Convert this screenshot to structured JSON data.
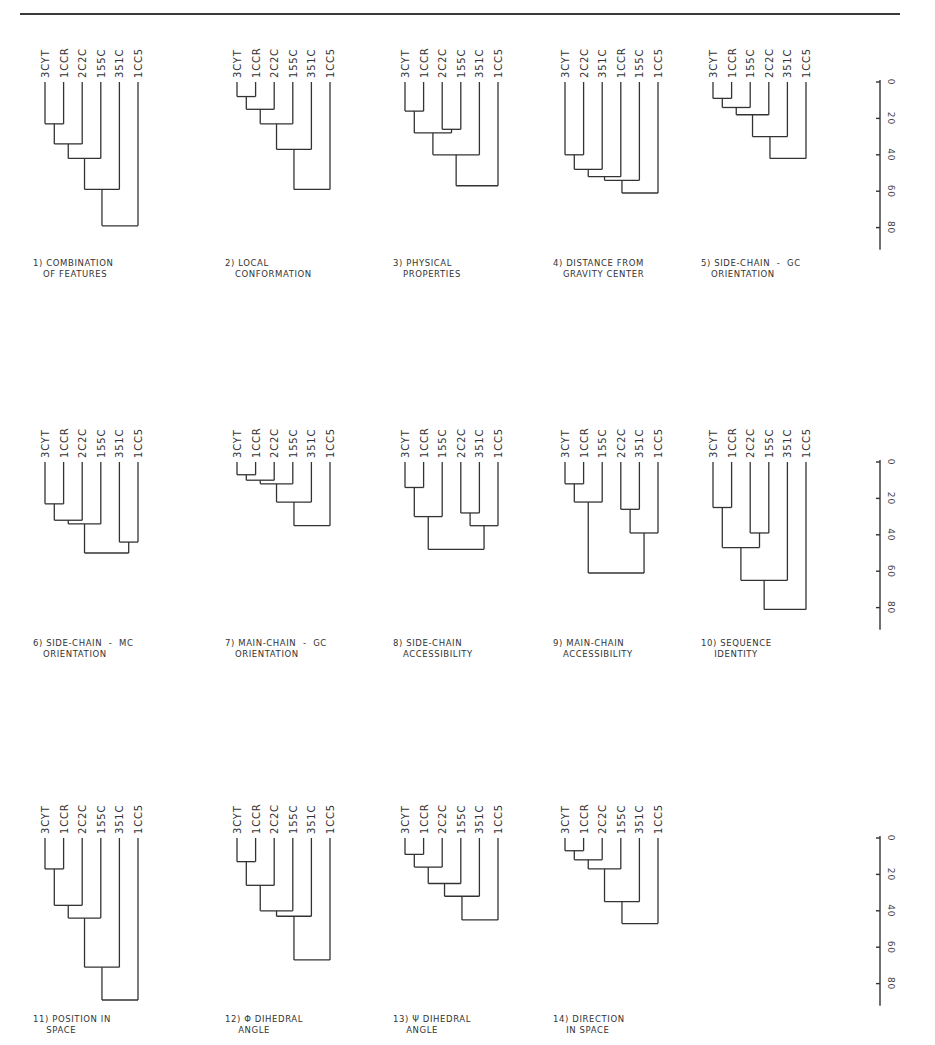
{
  "header": {
    "left_page": "",
    "center_title": "",
    "right_page": ""
  },
  "leaf_labels_note": "Protein codes",
  "axis": {
    "ticks": [
      0,
      20,
      40,
      60,
      80
    ],
    "min": 0,
    "max": 90
  },
  "chart_data": [
    {
      "id": 1,
      "type": "dendrogram",
      "title": "1) COMBINATION\n   OF FEATURES",
      "leaves": [
        "3CYT",
        "1CCR",
        "2C2C",
        "155C",
        "351C",
        "1CC5"
      ],
      "merges": [
        [
          0,
          1,
          23
        ],
        [
          0,
          2,
          34
        ],
        [
          0,
          3,
          42
        ],
        [
          0,
          4,
          59
        ],
        [
          0,
          5,
          79
        ]
      ]
    },
    {
      "id": 2,
      "type": "dendrogram",
      "title": "2) LOCAL\n   CONFORMATION",
      "leaves": [
        "3CYT",
        "1CCR",
        "2C2C",
        "155C",
        "351C",
        "1CC5"
      ],
      "merges": [
        [
          0,
          1,
          8
        ],
        [
          0,
          2,
          15
        ],
        [
          0,
          3,
          23
        ],
        [
          0,
          4,
          37
        ],
        [
          0,
          5,
          59
        ]
      ]
    },
    {
      "id": 3,
      "type": "dendrogram",
      "title": "3) PHYSICAL\n   PROPERTIES",
      "leaves": [
        "3CYT",
        "1CCR",
        "2C2C",
        "155C",
        "351C",
        "1CC5"
      ],
      "merges": [
        [
          0,
          1,
          16
        ],
        [
          2,
          3,
          26
        ],
        [
          0,
          2,
          28
        ],
        [
          0,
          4,
          40
        ],
        [
          0,
          5,
          57
        ]
      ]
    },
    {
      "id": 4,
      "type": "dendrogram",
      "title": "4) DISTANCE FROM\n   GRAVITY CENTER",
      "leaves": [
        "3CYT",
        "2C2C",
        "351C",
        "1CCR",
        "155C",
        "1CC5"
      ],
      "merges": [
        [
          0,
          1,
          40
        ],
        [
          0,
          2,
          48
        ],
        [
          0,
          3,
          52
        ],
        [
          0,
          4,
          54
        ],
        [
          0,
          5,
          61
        ]
      ]
    },
    {
      "id": 5,
      "type": "dendrogram",
      "title": "5) SIDE-CHAIN  -  GC\n   ORIENTATION",
      "leaves": [
        "3CYT",
        "1CCR",
        "155C",
        "2C2C",
        "351C",
        "1CC5"
      ],
      "merges": [
        [
          0,
          1,
          9
        ],
        [
          0,
          2,
          14
        ],
        [
          0,
          3,
          18
        ],
        [
          0,
          4,
          30
        ],
        [
          0,
          5,
          42
        ]
      ]
    },
    {
      "id": 6,
      "type": "dendrogram",
      "title": "6) SIDE-CHAIN  -  MC\n   ORIENTATION",
      "leaves": [
        "3CYT",
        "1CCR",
        "2C2C",
        "155C",
        "351C",
        "1CC5"
      ],
      "merges": [
        [
          0,
          1,
          23
        ],
        [
          0,
          2,
          32
        ],
        [
          0,
          3,
          34
        ],
        [
          4,
          5,
          44
        ],
        [
          0,
          4,
          50
        ]
      ]
    },
    {
      "id": 7,
      "type": "dendrogram",
      "title": "7) MAIN-CHAIN  -  GC\n   ORIENTATION",
      "leaves": [
        "3CYT",
        "1CCR",
        "2C2C",
        "155C",
        "351C",
        "1CC5"
      ],
      "merges": [
        [
          0,
          1,
          7
        ],
        [
          0,
          2,
          10
        ],
        [
          0,
          3,
          12
        ],
        [
          0,
          4,
          22
        ],
        [
          0,
          5,
          35
        ]
      ]
    },
    {
      "id": 8,
      "type": "dendrogram",
      "title": "8) SIDE-CHAIN\n   ACCESSIBILITY",
      "leaves": [
        "3CYT",
        "1CCR",
        "155C",
        "2C2C",
        "351C",
        "1CC5"
      ],
      "merges": [
        [
          0,
          1,
          14
        ],
        [
          0,
          2,
          30
        ],
        [
          3,
          4,
          28
        ],
        [
          3,
          5,
          35
        ],
        [
          0,
          3,
          48
        ]
      ]
    },
    {
      "id": 9,
      "type": "dendrogram",
      "title": "9) MAIN-CHAIN\n   ACCESSIBILITY",
      "leaves": [
        "3CYT",
        "1CCR",
        "155C",
        "2C2C",
        "351C",
        "1CC5"
      ],
      "merges": [
        [
          0,
          1,
          12
        ],
        [
          0,
          2,
          22
        ],
        [
          3,
          4,
          26
        ],
        [
          3,
          5,
          39
        ],
        [
          0,
          3,
          61
        ]
      ]
    },
    {
      "id": 10,
      "type": "dendrogram",
      "title": "10) SEQUENCE\n    IDENTITY",
      "leaves": [
        "3CYT",
        "1CCR",
        "2C2C",
        "155C",
        "351C",
        "1CC5"
      ],
      "merges": [
        [
          0,
          1,
          25
        ],
        [
          2,
          3,
          39
        ],
        [
          0,
          2,
          47
        ],
        [
          0,
          4,
          65
        ],
        [
          0,
          5,
          81
        ]
      ]
    },
    {
      "id": 11,
      "type": "dendrogram",
      "title": "11) POSITION IN\n    SPACE",
      "leaves": [
        "3CYT",
        "1CCR",
        "2C2C",
        "155C",
        "351C",
        "1CC5"
      ],
      "merges": [
        [
          0,
          1,
          17
        ],
        [
          0,
          2,
          37
        ],
        [
          0,
          3,
          44
        ],
        [
          0,
          4,
          71
        ],
        [
          0,
          5,
          89
        ]
      ]
    },
    {
      "id": 12,
      "type": "dendrogram",
      "title": "12) Φ DIHEDRAL\n    ANGLE",
      "leaves": [
        "3CYT",
        "1CCR",
        "2C2C",
        "155C",
        "351C",
        "1CC5"
      ],
      "merges": [
        [
          0,
          1,
          13
        ],
        [
          0,
          2,
          26
        ],
        [
          0,
          3,
          40
        ],
        [
          0,
          4,
          43
        ],
        [
          0,
          5,
          67
        ]
      ]
    },
    {
      "id": 13,
      "type": "dendrogram",
      "title": "13) Ψ DIHEDRAL\n    ANGLE",
      "leaves": [
        "3CYT",
        "1CCR",
        "2C2C",
        "155C",
        "351C",
        "1CC5"
      ],
      "merges": [
        [
          0,
          1,
          9
        ],
        [
          0,
          2,
          16
        ],
        [
          0,
          3,
          25
        ],
        [
          0,
          4,
          32
        ],
        [
          0,
          5,
          45
        ]
      ]
    },
    {
      "id": 14,
      "type": "dendrogram",
      "title": "14) DIRECTION\n    IN SPACE",
      "leaves": [
        "3CYT",
        "1CCR",
        "2C2C",
        "155C",
        "351C",
        "1CC5"
      ],
      "merges": [
        [
          0,
          1,
          7
        ],
        [
          0,
          2,
          12
        ],
        [
          0,
          3,
          17
        ],
        [
          0,
          4,
          35
        ],
        [
          0,
          5,
          47
        ]
      ]
    }
  ]
}
